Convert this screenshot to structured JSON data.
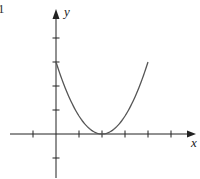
{
  "figure": {
    "corner_label": "1"
  },
  "chart_data": {
    "type": "line",
    "title": "",
    "xlabel": "x",
    "ylabel": "y",
    "function": "y = 0.75 * (x - 2)^2",
    "x": [
      0,
      0.5,
      1,
      1.5,
      2,
      2.5,
      3,
      3.5,
      4
    ],
    "values": [
      3,
      1.6875,
      0.75,
      0.1875,
      0,
      0.1875,
      0.75,
      1.6875,
      3
    ],
    "xlim": [
      -3,
      6
    ],
    "ylim": [
      -2,
      5
    ],
    "x_ticks": [
      -1,
      1,
      2,
      3,
      4,
      5
    ],
    "y_ticks": [
      -1,
      1,
      2,
      3,
      4
    ],
    "tick_labels_shown": false,
    "grid": false,
    "legend": null,
    "vertex": [
      2,
      0
    ],
    "y_intercept": [
      0,
      3
    ]
  },
  "colors": {
    "axis": "#222222",
    "curve": "#555555"
  }
}
